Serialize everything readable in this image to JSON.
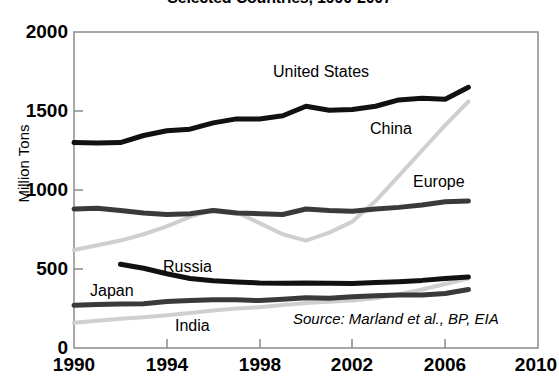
{
  "chart_data": {
    "type": "line",
    "title": "Selected Countries, 1990-2007",
    "xlabel": "",
    "ylabel": "Million Tons",
    "xlim": [
      1990,
      2010
    ],
    "ylim": [
      0,
      2000
    ],
    "xticks": [
      1990,
      1994,
      1998,
      2002,
      2006,
      2010
    ],
    "yticks": [
      0,
      500,
      1000,
      1500,
      2000
    ],
    "grid": false,
    "legend_position": "inline-labels",
    "source_note": "Source: Marland et al., BP, EIA",
    "series": [
      {
        "name": "United States",
        "color": "#111111",
        "width": 5,
        "x": [
          1990,
          1991,
          1992,
          1993,
          1994,
          1995,
          1996,
          1997,
          1998,
          1999,
          2000,
          2001,
          2002,
          2003,
          2004,
          2005,
          2006,
          2007
        ],
        "values": [
          1300,
          1297,
          1300,
          1345,
          1375,
          1385,
          1425,
          1450,
          1450,
          1470,
          1530,
          1505,
          1510,
          1530,
          1570,
          1580,
          1575,
          1650
        ]
      },
      {
        "name": "China",
        "color": "#cfcfcf",
        "width": 4,
        "x": [
          1990,
          1991,
          1992,
          1993,
          1994,
          1995,
          1996,
          1997,
          1998,
          1999,
          2000,
          2001,
          2002,
          2003,
          2004,
          2005,
          2006,
          2007
        ],
        "values": [
          620,
          650,
          680,
          720,
          770,
          830,
          875,
          860,
          790,
          720,
          680,
          730,
          800,
          930,
          1090,
          1250,
          1410,
          1560
        ]
      },
      {
        "name": "Europe",
        "color": "#3a3a3a",
        "width": 5,
        "x": [
          1990,
          1991,
          1992,
          1993,
          1994,
          1995,
          1996,
          1997,
          1998,
          1999,
          2000,
          2001,
          2002,
          2003,
          2004,
          2005,
          2006,
          2007
        ],
        "values": [
          880,
          885,
          870,
          855,
          845,
          850,
          870,
          855,
          850,
          845,
          880,
          870,
          865,
          880,
          890,
          905,
          925,
          930
        ]
      },
      {
        "name": "Russia",
        "color": "#111111",
        "width": 5,
        "x": [
          1992,
          1993,
          1994,
          1995,
          1996,
          1997,
          1998,
          1999,
          2000,
          2001,
          2002,
          2003,
          2004,
          2005,
          2006,
          2007
        ],
        "values": [
          530,
          505,
          470,
          440,
          425,
          418,
          412,
          410,
          412,
          410,
          408,
          415,
          420,
          428,
          440,
          450
        ]
      },
      {
        "name": "Japan",
        "color": "#3a3a3a",
        "width": 5,
        "x": [
          1990,
          1991,
          1992,
          1993,
          1994,
          1995,
          1996,
          1997,
          1998,
          1999,
          2000,
          2001,
          2002,
          2003,
          2004,
          2005,
          2006,
          2007
        ],
        "values": [
          270,
          275,
          278,
          280,
          295,
          300,
          305,
          305,
          300,
          308,
          318,
          315,
          325,
          330,
          335,
          335,
          345,
          370
        ]
      },
      {
        "name": "India",
        "color": "#cfcfcf",
        "width": 4,
        "x": [
          1990,
          1991,
          1992,
          1993,
          1994,
          1995,
          1996,
          1997,
          1998,
          1999,
          2000,
          2001,
          2002,
          2003,
          2004,
          2005,
          2006,
          2007
        ],
        "values": [
          160,
          172,
          185,
          195,
          208,
          222,
          238,
          250,
          258,
          272,
          285,
          292,
          300,
          315,
          340,
          370,
          405,
          440
        ]
      }
    ]
  },
  "axis": {
    "y_title": "Million Tons",
    "y_ticks": [
      "0",
      "500",
      "1000",
      "1500",
      "2000"
    ],
    "x_ticks": [
      "1990",
      "1994",
      "1998",
      "2002",
      "2006",
      "2010"
    ]
  },
  "labels": {
    "united_states": "United States",
    "china": "China",
    "europe": "Europe",
    "russia": "Russia",
    "japan": "Japan",
    "india": "India"
  },
  "source": {
    "text": "Source: Marland et al., BP, EIA"
  },
  "title": {
    "text": "Selected Countries, 1990-2007"
  }
}
